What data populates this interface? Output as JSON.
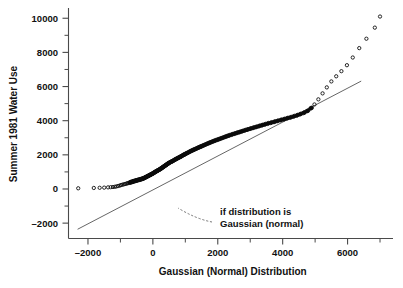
{
  "chart_data": {
    "type": "scatter",
    "title": "",
    "xlabel": "Gaussian (Normal) Distribution",
    "ylabel": "Summer 1981 Water Use",
    "xlim": [
      -2600,
      7400
    ],
    "ylim": [
      -2900,
      10600
    ],
    "xticks": [
      -2000,
      0,
      2000,
      4000,
      6000
    ],
    "yticks": [
      -2000,
      0,
      2000,
      4000,
      6000,
      8000,
      10000
    ],
    "xtick_labels": [
      "–2000",
      "0",
      "2000",
      "4000",
      "6000"
    ],
    "ytick_labels": [
      "–2000",
      "0",
      "2000",
      "4000",
      "6000",
      "8000",
      "10000"
    ],
    "x_minor_interval": 500,
    "y_minor_interval": 1000,
    "grid": false,
    "legend": null,
    "annotations": [
      {
        "name": "reference-line-note",
        "text_line_1": "if distribution is",
        "text_line_2": "Gaussian (normal)",
        "text_x": 220,
        "text_y": 215,
        "leader_from_x": 212,
        "leader_from_y": 222,
        "leader_to_x": 178,
        "leader_to_y": 208
      }
    ],
    "series": [
      {
        "name": "reference_line",
        "label": "if distribution is Gaussian (normal)",
        "type": "line",
        "color": "#555555",
        "points": [
          [
            -2320,
            -2360
          ],
          [
            6420,
            6320
          ]
        ]
      },
      {
        "name": "water_use_quantiles",
        "label": "Summer 1981 Water Use quantiles",
        "type": "scatter",
        "marker": "open-circle",
        "color": "#101010",
        "x": [
          -2300,
          -1820,
          -1640,
          -1500,
          -1380,
          -1300,
          -1230,
          -1170,
          -1120,
          -1070,
          -1020,
          -980,
          -940,
          -900,
          -860,
          -820,
          -790,
          -755,
          -720,
          -690,
          -660,
          -630,
          -600,
          -570,
          -540,
          -510,
          -480,
          -450,
          -420,
          -390,
          -360,
          -330,
          -300,
          -270,
          -240,
          -210,
          -180,
          -150,
          -120,
          -90,
          -60,
          -30,
          0,
          30,
          60,
          90,
          120,
          150,
          180,
          210,
          240,
          270,
          300,
          330,
          360,
          390,
          420,
          450,
          480,
          520,
          560,
          600,
          640,
          680,
          720,
          760,
          800,
          840,
          880,
          920,
          960,
          1000,
          1050,
          1100,
          1150,
          1200,
          1250,
          1300,
          1350,
          1400,
          1450,
          1500,
          1560,
          1620,
          1680,
          1740,
          1800,
          1860,
          1920,
          1990,
          2060,
          2130,
          2200,
          2270,
          2340,
          2420,
          2500,
          2580,
          2660,
          2740,
          2820,
          2900,
          2990,
          3080,
          3170,
          3260,
          3350,
          3440,
          3530,
          3630,
          3730,
          3830,
          3930,
          4030,
          4130,
          4230,
          4330,
          4430,
          4530,
          4640,
          4750,
          4860,
          4980,
          5100,
          5230,
          5360,
          5500,
          5650,
          5810,
          5980,
          6160,
          6360,
          6580,
          6840,
          7000
        ],
        "y": [
          40,
          60,
          70,
          80,
          95,
          105,
          115,
          130,
          150,
          175,
          200,
          230,
          250,
          270,
          290,
          310,
          330,
          350,
          370,
          385,
          400,
          420,
          440,
          455,
          470,
          490,
          505,
          520,
          535,
          550,
          570,
          590,
          610,
          640,
          670,
          700,
          730,
          760,
          790,
          820,
          850,
          880,
          910,
          950,
          990,
          1020,
          1050,
          1085,
          1115,
          1150,
          1190,
          1230,
          1270,
          1310,
          1350,
          1390,
          1430,
          1470,
          1510,
          1550,
          1590,
          1630,
          1675,
          1720,
          1760,
          1800,
          1840,
          1880,
          1925,
          1970,
          2010,
          2050,
          2100,
          2150,
          2200,
          2245,
          2290,
          2330,
          2375,
          2420,
          2460,
          2500,
          2550,
          2600,
          2650,
          2700,
          2745,
          2790,
          2835,
          2880,
          2930,
          2980,
          3030,
          3080,
          3125,
          3175,
          3225,
          3275,
          3320,
          3370,
          3420,
          3465,
          3520,
          3570,
          3620,
          3670,
          3720,
          3770,
          3820,
          3870,
          3920,
          3975,
          4025,
          4075,
          4130,
          4180,
          4240,
          4300,
          4370,
          4450,
          4560,
          4720,
          4950,
          5250,
          5600,
          5950,
          6300,
          6600,
          6900,
          7250,
          7700,
          8250,
          8800,
          9450,
          10100
        ],
        "dense_band_from_index": 18,
        "dense_band_to_index": 121
      }
    ]
  },
  "axes": {
    "x_axis_name": "gaussian-normal-distribution-axis",
    "y_axis_name": "summer-1981-water-use-axis"
  }
}
